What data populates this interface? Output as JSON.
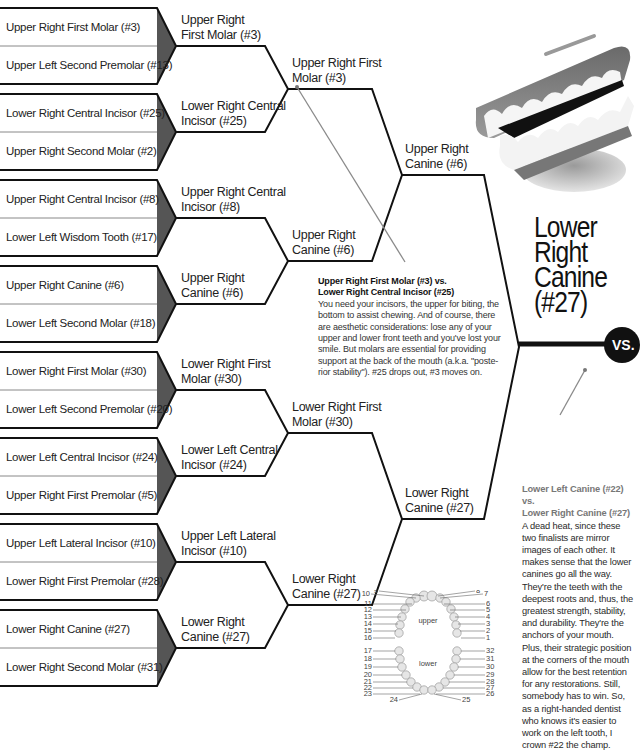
{
  "round1": [
    {
      "top": "Upper Right First Molar (#3)",
      "bottom": "Upper Left Second Premolar (#13)"
    },
    {
      "top": "Lower Right Central Incisor (#25)",
      "bottom": "Upper Right Second Molar (#2)"
    },
    {
      "top": "Upper Right Central Incisor (#8)",
      "bottom": "Lower Left Wisdom Tooth (#17)"
    },
    {
      "top": "Upper Right Canine (#6)",
      "bottom": "Lower Left Second Molar (#18)"
    },
    {
      "top": "Lower Right First Molar (#30)",
      "bottom": "Lower Left Second Premolar (#20)"
    },
    {
      "top": "Lower Left Central Incisor (#24)",
      "bottom": "Upper Right First Premolar (#5)"
    },
    {
      "top": "Upper Left Lateral Incisor (#10)",
      "bottom": "Lower Right First Premolar (#28)"
    },
    {
      "top": "Lower Right Canine (#27)",
      "bottom": "Lower Right Second Molar (#31)"
    }
  ],
  "round2": [
    {
      "line1": "Upper Right",
      "line2": "First Molar (#3)"
    },
    {
      "line1": "Lower Right Central",
      "line2": "Incisor (#25)"
    },
    {
      "line1": "Upper Right Central",
      "line2": "Incisor (#8)"
    },
    {
      "line1": "Upper Right",
      "line2": "Canine (#6)"
    },
    {
      "line1": "Lower Right First",
      "line2": "Molar (#30)"
    },
    {
      "line1": "Lower Left Central",
      "line2": "Incisor (#24)"
    },
    {
      "line1": "Upper Left Lateral",
      "line2": "Incisor (#10)"
    },
    {
      "line1": "Lower Right",
      "line2": "Canine (#27)"
    }
  ],
  "round3": [
    {
      "line1": "Upper Right First",
      "line2": "Molar (#3)"
    },
    {
      "line1": "Upper Right",
      "line2": "Canine (#6)"
    },
    {
      "line1": "Lower Right First",
      "line2": "Molar (#30)"
    },
    {
      "line1": "Lower Right",
      "line2": "Canine (#27)"
    }
  ],
  "round4": [
    {
      "line1": "Upper Right",
      "line2": "Canine (#6)"
    },
    {
      "line1": "Lower Right",
      "line2": "Canine (#27)"
    }
  ],
  "finalist": {
    "line1": "Lower",
    "line2": "Right",
    "line3": "Canine",
    "line4": "(#27)"
  },
  "vs_label": "VS.",
  "note1": {
    "heading1": "Upper Right First Molar (#3) vs.",
    "heading2": "Lower Right Central Incisor (#25)",
    "body": "You need your incisors, the upper for biting, the bottom to assist chewing. And of course, there are aesthetic considerations: lose any of your upper and lower front teeth and you've lost your smile. But molars are essential for providing support at the back of the mouth (a.k.a. \"poste-rior stability\"). #25 drops out, #3 moves on."
  },
  "note2": {
    "heading1": "Lower Left Canine (#22) vs.",
    "heading2": "Lower Right Canine (#27)",
    "body": "A dead heat, since these two finalists are mirror images of each other. It makes sense that the lower canines go all the way. They're the teeth with the deepest roots and, thus, the greatest strength, stability, and durability. They're the anchors of your mouth. Plus, their strategic position at the corners of the mouth allow for the best retention for any restorations. Still, somebody has to win. So, as a right-handed dentist who knows it's easier to work on the left tooth, I crown #22 the champ."
  },
  "tooth_chart": {
    "upper_label": "upper",
    "lower_label": "lower",
    "upper_left_numbers": [
      "10",
      "9",
      "11",
      "12",
      "13",
      "14",
      "15",
      "16"
    ],
    "upper_right_numbers": [
      "8",
      "7",
      "6",
      "5",
      "4",
      "3",
      "2",
      "1"
    ],
    "lower_left_numbers": [
      "17",
      "18",
      "19",
      "20",
      "21",
      "22",
      "23",
      "24"
    ],
    "lower_right_numbers": [
      "32",
      "31",
      "30",
      "29",
      "28",
      "27",
      "26",
      "25"
    ]
  },
  "colors": {
    "line": "#111111",
    "arrow_fill": "#555555",
    "pointer": "#8a8a8a"
  }
}
